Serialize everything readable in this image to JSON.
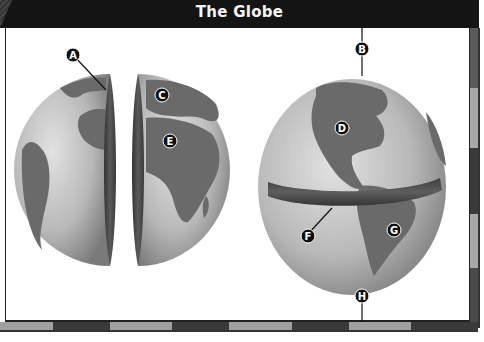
{
  "title": "The Globe",
  "colors": {
    "title_bar": "#141414",
    "title_text": "#f4f4f4",
    "ocean": "#b5b5b5",
    "land": "#6a6a6a",
    "cut_edge": "#4a4a4a",
    "label_marker": "#111111"
  },
  "diagram": {
    "left_figure": "globe-split-into-hemispheres",
    "right_figure": "whole-globe-with-equator-band",
    "labels": [
      {
        "id": "A",
        "text": "A",
        "points_to": "cut edge of western hemisphere (prime meridian)"
      },
      {
        "id": "B",
        "text": "B",
        "points_to": "north pole"
      },
      {
        "id": "C",
        "text": "C",
        "points_to": "Europe"
      },
      {
        "id": "D",
        "text": "D",
        "points_to": "North America"
      },
      {
        "id": "E",
        "text": "E",
        "points_to": "Africa"
      },
      {
        "id": "F",
        "text": "F",
        "points_to": "equator band"
      },
      {
        "id": "G",
        "text": "G",
        "points_to": "South America"
      },
      {
        "id": "H",
        "text": "H",
        "points_to": "south pole"
      }
    ]
  }
}
